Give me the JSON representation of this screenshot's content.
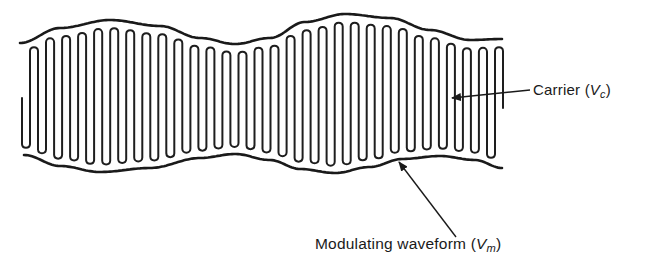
{
  "figure": {
    "type": "amplitude-modulated waveform",
    "labels": {
      "carrier": {
        "text": "Carrier",
        "open_paren": "(",
        "symbol": "V",
        "subscript": "c",
        "close_paren": ")"
      },
      "modulating": {
        "text": "Modulating waveform",
        "open_paren": "(",
        "symbol": "V",
        "subscript": "m",
        "close_paren": ")"
      }
    },
    "colors": {
      "stroke": "#1a1a1a",
      "background": "#ffffff"
    },
    "carrier_wave": {
      "x_start": 22,
      "x_end": 503,
      "cycles": 30,
      "center_y": 98
    },
    "envelope_top": [
      [
        20,
        43
      ],
      [
        60,
        28
      ],
      [
        110,
        20
      ],
      [
        160,
        26
      ],
      [
        200,
        38
      ],
      [
        235,
        44
      ],
      [
        270,
        38
      ],
      [
        305,
        22
      ],
      [
        345,
        14
      ],
      [
        390,
        18
      ],
      [
        430,
        30
      ],
      [
        470,
        40
      ],
      [
        502,
        39
      ]
    ],
    "envelope_bottom": [
      [
        24,
        155
      ],
      [
        60,
        166
      ],
      [
        100,
        172
      ],
      [
        150,
        168
      ],
      [
        200,
        158
      ],
      [
        235,
        154
      ],
      [
        270,
        160
      ],
      [
        300,
        169
      ],
      [
        335,
        173
      ],
      [
        370,
        167
      ],
      [
        402,
        159
      ],
      [
        440,
        156
      ],
      [
        475,
        160
      ],
      [
        502,
        168
      ]
    ],
    "leaders": {
      "carrier": {
        "from": [
          530,
          90
        ],
        "to": [
          452,
          98
        ]
      },
      "modulating": {
        "from": [
          456,
          237
        ],
        "to": [
          399,
          162
        ]
      }
    }
  }
}
